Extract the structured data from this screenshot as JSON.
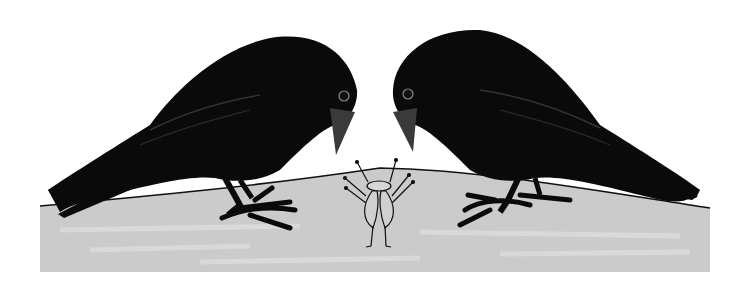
{
  "illustration": {
    "subject": "Two crows looking down at a small insect on a mound",
    "colors": {
      "background": "#ffffff",
      "ground": "#c9c9c9",
      "ground_light": "#dadada",
      "outline": "#111111",
      "crow": "#0a0a0a",
      "beak": "#3a3a3a",
      "insect_fill": "#d0d0d0"
    },
    "elements": [
      {
        "name": "left-crow",
        "facing": "right"
      },
      {
        "name": "right-crow",
        "facing": "left"
      },
      {
        "name": "insect",
        "position": "center"
      },
      {
        "name": "ground-mound"
      }
    ]
  }
}
